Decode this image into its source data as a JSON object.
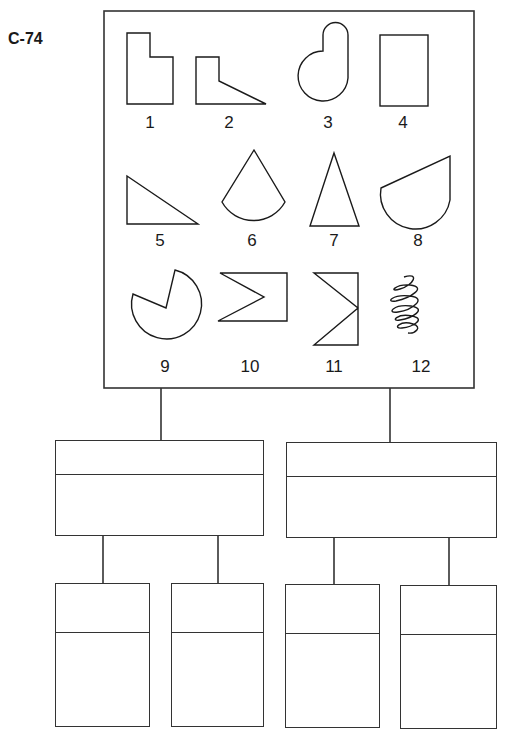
{
  "title": "C-74",
  "shapes_panel": {
    "shapes": [
      {
        "number": "1",
        "kind": "L-shaped rectangle (stepped)"
      },
      {
        "number": "2",
        "kind": "L-shape with diagonal edge"
      },
      {
        "number": "3",
        "kind": "circle with rounded lobe (keyhole)"
      },
      {
        "number": "4",
        "kind": "rectangle"
      },
      {
        "number": "5",
        "kind": "right triangle"
      },
      {
        "number": "6",
        "kind": "circular sector (cone)"
      },
      {
        "number": "7",
        "kind": "isosceles triangle"
      },
      {
        "number": "8",
        "kind": "semicircle with slanted top"
      },
      {
        "number": "9",
        "kind": "circle with wedge cut out"
      },
      {
        "number": "10",
        "kind": "rectangle with notch"
      },
      {
        "number": "11",
        "kind": "rectangle with notch (left)"
      },
      {
        "number": "12",
        "kind": "coil / spiral scribble"
      }
    ]
  },
  "tree": {
    "level1": [
      {
        "id": "mid-left",
        "header": "",
        "body": ""
      },
      {
        "id": "mid-right",
        "header": "",
        "body": ""
      }
    ],
    "level2": [
      {
        "id": "leaf-1",
        "parent": "mid-left",
        "header": "",
        "body": ""
      },
      {
        "id": "leaf-2",
        "parent": "mid-left",
        "header": "",
        "body": ""
      },
      {
        "id": "leaf-3",
        "parent": "mid-right",
        "header": "",
        "body": ""
      },
      {
        "id": "leaf-4",
        "parent": "mid-right",
        "header": "",
        "body": ""
      }
    ]
  },
  "colors": {
    "ink": "#1a1a1a",
    "background": "#ffffff"
  }
}
